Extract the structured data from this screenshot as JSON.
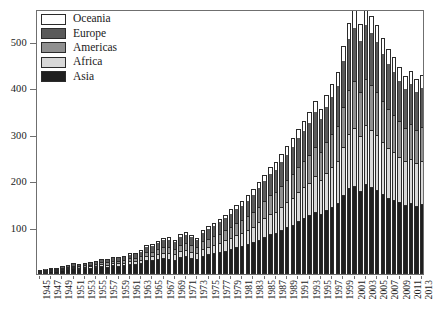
{
  "chart_data": {
    "type": "bar",
    "subtype": "stacked-bar",
    "title": "",
    "xlabel": "",
    "ylabel": "",
    "grid": false,
    "legend_position": "top-left",
    "xlim": [
      1945,
      2013
    ],
    "ylim": [
      0,
      570
    ],
    "yticks": [
      100,
      200,
      300,
      400,
      500
    ],
    "ytick_labels": [
      "100",
      "200",
      "300",
      "400",
      "500"
    ],
    "x": [
      1945,
      1946,
      1947,
      1948,
      1949,
      1950,
      1951,
      1952,
      1953,
      1954,
      1955,
      1956,
      1957,
      1958,
      1959,
      1960,
      1961,
      1962,
      1963,
      1964,
      1965,
      1966,
      1967,
      1968,
      1969,
      1970,
      1971,
      1972,
      1973,
      1974,
      1975,
      1976,
      1977,
      1978,
      1979,
      1980,
      1981,
      1982,
      1983,
      1984,
      1985,
      1986,
      1987,
      1988,
      1989,
      1990,
      1991,
      1992,
      1993,
      1994,
      1995,
      1996,
      1997,
      1998,
      1999,
      2000,
      2001,
      2002,
      2003,
      2004,
      2005,
      2006,
      2007,
      2008,
      2009,
      2010,
      2011,
      2012,
      2013
    ],
    "xtick_labels": [
      "1945",
      "1947",
      "1949",
      "1951",
      "1953",
      "1955",
      "1957",
      "1959",
      "1961",
      "1963",
      "1965",
      "1967",
      "1969",
      "1971",
      "1973",
      "1975",
      "1977",
      "1979",
      "1981",
      "1983",
      "1985",
      "1987",
      "1989",
      "1991",
      "1993",
      "1995",
      "1997",
      "1999",
      "2001",
      "2003",
      "2005",
      "2007",
      "2009",
      "2011",
      "2013"
    ],
    "stack_order_bottom_to_top": [
      "Asia",
      "Africa",
      "Americas",
      "Europe",
      "Oceania"
    ],
    "series": [
      {
        "name": "Asia",
        "color": "#1f1f1f",
        "values": [
          4,
          5,
          6,
          6,
          8,
          9,
          12,
          10,
          11,
          12,
          13,
          15,
          14,
          18,
          16,
          17,
          19,
          20,
          22,
          28,
          27,
          30,
          33,
          31,
          29,
          34,
          36,
          33,
          30,
          37,
          40,
          42,
          45,
          48,
          52,
          55,
          58,
          62,
          66,
          72,
          78,
          84,
          86,
          92,
          98,
          104,
          112,
          118,
          124,
          132,
          128,
          136,
          142,
          150,
          168,
          182,
          188,
          176,
          192,
          186,
          178,
          170,
          162,
          158,
          152,
          146,
          150,
          144,
          148
        ]
      },
      {
        "name": "Africa",
        "color": "#d8d8d8",
        "values": [
          1,
          1,
          1,
          1,
          2,
          2,
          2,
          2,
          3,
          3,
          3,
          4,
          4,
          4,
          5,
          5,
          6,
          6,
          7,
          8,
          9,
          10,
          11,
          12,
          11,
          13,
          14,
          13,
          12,
          15,
          17,
          18,
          20,
          22,
          24,
          26,
          28,
          31,
          34,
          37,
          40,
          44,
          46,
          50,
          54,
          58,
          62,
          66,
          70,
          76,
          72,
          80,
          86,
          92,
          104,
          116,
          124,
          118,
          126,
          122,
          118,
          112,
          106,
          102,
          98,
          94,
          96,
          92,
          94
        ]
      },
      {
        "name": "Americas",
        "color": "#909090",
        "values": [
          1,
          1,
          2,
          2,
          2,
          3,
          3,
          3,
          4,
          4,
          4,
          5,
          5,
          5,
          6,
          6,
          7,
          7,
          8,
          9,
          10,
          11,
          12,
          13,
          12,
          14,
          15,
          14,
          13,
          16,
          17,
          19,
          20,
          22,
          24,
          26,
          27,
          29,
          32,
          34,
          37,
          40,
          42,
          45,
          48,
          51,
          54,
          57,
          60,
          64,
          61,
          66,
          70,
          75,
          86,
          95,
          100,
          95,
          100,
          97,
          94,
          88,
          84,
          80,
          76,
          73,
          74,
          71,
          72
        ]
      },
      {
        "name": "Europe",
        "color": "#5a5a5a",
        "values": [
          2,
          3,
          3,
          3,
          4,
          4,
          5,
          5,
          5,
          6,
          6,
          7,
          7,
          8,
          8,
          9,
          10,
          10,
          11,
          13,
          14,
          15,
          17,
          18,
          16,
          19,
          20,
          19,
          18,
          21,
          23,
          24,
          26,
          28,
          30,
          32,
          34,
          36,
          39,
          42,
          45,
          48,
          50,
          54,
          57,
          60,
          64,
          67,
          71,
          76,
          72,
          78,
          83,
          88,
          100,
          112,
          118,
          112,
          118,
          114,
          110,
          104,
          99,
          95,
          90,
          86,
          88,
          84,
          86
        ]
      },
      {
        "name": "Oceania",
        "color": "#ffffff",
        "values": [
          0,
          0,
          1,
          1,
          1,
          1,
          1,
          1,
          1,
          1,
          2,
          2,
          2,
          2,
          2,
          2,
          3,
          3,
          3,
          4,
          4,
          4,
          5,
          5,
          5,
          6,
          6,
          6,
          5,
          6,
          7,
          7,
          8,
          8,
          9,
          10,
          10,
          11,
          12,
          13,
          14,
          15,
          16,
          17,
          18,
          19,
          20,
          21,
          23,
          24,
          23,
          25,
          27,
          29,
          33,
          36,
          38,
          36,
          38,
          37,
          36,
          34,
          32,
          31,
          29,
          28,
          29,
          28,
          28
        ]
      }
    ],
    "totals": [
      8,
      10,
      13,
      13,
      17,
      19,
      23,
      21,
      24,
      26,
      28,
      33,
      32,
      37,
      37,
      39,
      45,
      46,
      51,
      62,
      64,
      70,
      78,
      79,
      73,
      86,
      91,
      85,
      78,
      95,
      104,
      110,
      119,
      128,
      139,
      149,
      157,
      169,
      183,
      198,
      214,
      231,
      240,
      258,
      275,
      292,
      312,
      329,
      348,
      372,
      356,
      385,
      408,
      434,
      491,
      541,
      568,
      537,
      574,
      556,
      536,
      508,
      483,
      466,
      445,
      427,
      437,
      419,
      428
    ]
  },
  "legend": {
    "items": [
      {
        "label": "Oceania",
        "color": "#ffffff"
      },
      {
        "label": "Europe",
        "color": "#5a5a5a"
      },
      {
        "label": "Americas",
        "color": "#909090"
      },
      {
        "label": "Africa",
        "color": "#d8d8d8"
      },
      {
        "label": "Asia",
        "color": "#1f1f1f"
      }
    ]
  }
}
